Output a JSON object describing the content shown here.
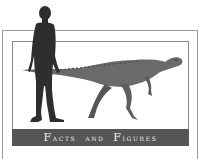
{
  "figure": {
    "subject_left": "human-silhouette",
    "subject_right": "dinosaur-illustration",
    "caption_type": "size-comparison"
  },
  "banner": {
    "word1_cap": "F",
    "word1_rest": "acts",
    "word2": "and",
    "word3_cap": "F",
    "word3_rest": "igures",
    "full_text": "FACTS AND FIGURES"
  },
  "cut_heading": {
    "text": "▄▄  ▄▄  ▄  ▄"
  },
  "colors": {
    "banner_bg": "#555555",
    "banner_text": "#f2f2f2",
    "frame": "#9a9a9a",
    "human": "#2e2e2e",
    "dinosaur": "#6a6a6a"
  }
}
